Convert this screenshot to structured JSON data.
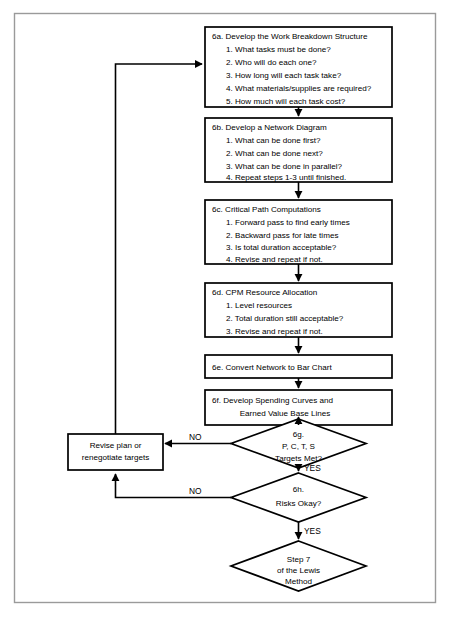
{
  "diagram": {
    "colors": {
      "frame": "#9a9a9a",
      "node_stroke": "#000000",
      "node_fill": "#ffffff",
      "connector": "#000000",
      "text": "#000000"
    },
    "nodes": {
      "wbs": {
        "id": "6a",
        "heading": "6a. Develop the Work Breakdown Structure",
        "items": [
          "1. What tasks must be done?",
          "2. Who will do each one?",
          "3. How long will each task take?",
          "4. What materials/supplies are required?",
          "5. How much will each task cost?"
        ]
      },
      "network": {
        "id": "6b",
        "heading": "6b. Develop a Network Diagram",
        "items": [
          "1. What can be done first?",
          "2. What can be done next?",
          "3. What can be done in parallel?",
          "4. Repeat steps 1-3 until finished."
        ]
      },
      "critical_path": {
        "id": "6c",
        "heading": "6c. Critical Path Computations",
        "items": [
          "1. Forward pass to find early times",
          "2. Backward pass for late times",
          "3. Is total duration acceptable?",
          "4. Revise and repeat if not."
        ]
      },
      "resource_allocation": {
        "id": "6d",
        "heading": "6d. CPM Resource Allocation",
        "items": [
          "1. Level resources",
          "2. Total duration still acceptable?",
          "3. Revise and repeat if not."
        ]
      },
      "bar_chart": {
        "id": "6e",
        "heading": "6e. Convert Network to Bar Chart",
        "items": []
      },
      "spending_curves": {
        "id": "6f",
        "heading": "6f. Develop Spending Curves and",
        "items": [
          "Earned Value Base Lines"
        ]
      },
      "revise_plan": {
        "id": "revise",
        "lines": [
          "Revise plan or",
          "renegotiate targets"
        ]
      },
      "targets_met": {
        "id": "6g",
        "lines": [
          "6g.",
          "P, C, T, S",
          "Targets Met?"
        ]
      },
      "risks_okay": {
        "id": "6h",
        "lines": [
          "6h.",
          "Risks Okay?"
        ]
      },
      "step7": {
        "id": "step7",
        "lines": [
          "Step 7",
          "of the Lewis",
          "Method"
        ]
      }
    },
    "edge_labels": {
      "targets_no": "NO",
      "targets_yes": "YES",
      "risks_no": "NO",
      "risks_yes": "YES"
    }
  }
}
